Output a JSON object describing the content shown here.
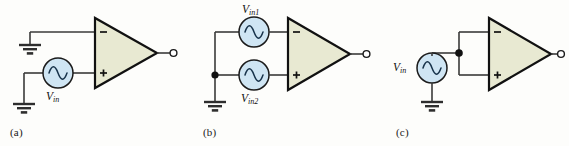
{
  "figure": {
    "background_color": "#fdfdfb",
    "width": 569,
    "height": 146
  },
  "colors": {
    "opamp_fill": "#e8e9d2",
    "source_fill": "#cfe5f3",
    "wire": "#3a3a3a",
    "outline": "#111111",
    "text": "#111111"
  },
  "panels": [
    {
      "id": "a",
      "label": "(a)",
      "description": "single-ended input applied to noninverting terminal, inverting terminal grounded",
      "opamp": {
        "inverting_label": "−",
        "noninverting_label": "+",
        "output_terminal": "open-circle"
      },
      "sources": [
        {
          "name": "vin",
          "label": "V",
          "sub": "in",
          "symbol": "sine-source"
        }
      ],
      "grounds": 2
    },
    {
      "id": "b",
      "label": "(b)",
      "description": "two grounded sources driving inverting and noninverting terminals",
      "opamp": {
        "inverting_label": "−",
        "noninverting_label": "+",
        "output_terminal": "open-circle"
      },
      "sources": [
        {
          "name": "vin1",
          "label": "V",
          "sub": "in1",
          "symbol": "sine-source"
        },
        {
          "name": "vin2",
          "label": "V",
          "sub": "in2",
          "symbol": "sine-source"
        }
      ],
      "grounds": 1,
      "junctions": 1
    },
    {
      "id": "c",
      "label": "(c)",
      "description": "common-mode drive: both inputs tied together to one source",
      "opamp": {
        "inverting_label": "−",
        "noninverting_label": "+",
        "output_terminal": "open-circle"
      },
      "sources": [
        {
          "name": "vin",
          "label": "V",
          "sub": "in",
          "symbol": "sine-source"
        }
      ],
      "grounds": 1,
      "junctions": 1
    }
  ]
}
